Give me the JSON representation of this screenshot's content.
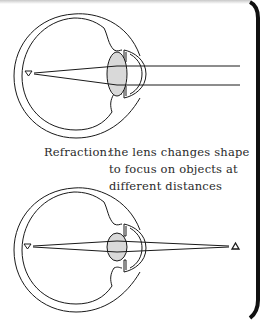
{
  "caption": {
    "label": "Refraction:",
    "line1": "the lens changes shape",
    "line2": "to focus on objects at",
    "line3": "different distances"
  },
  "diagrams": [
    {
      "name": "eye-distant-object",
      "description": "parallel rays from a distant object focused on the retina"
    },
    {
      "name": "eye-near-object",
      "description": "diverging rays from a near object focused on the retina"
    }
  ],
  "colors": {
    "stroke": "#1a1a1a",
    "lens_fill": "#d9d9d9",
    "border": "#111111"
  }
}
